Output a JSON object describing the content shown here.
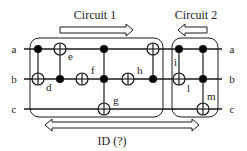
{
  "diagram": {
    "title_circuit1": "Circuit 1",
    "title_circuit2": "Circuit 2",
    "bottom_label": "ID (?)",
    "wires": [
      {
        "name": "a",
        "y": 49,
        "left_label": "a",
        "right_label": "a"
      },
      {
        "name": "b",
        "y": 79,
        "left_label": "b",
        "right_label": "b"
      },
      {
        "name": "c",
        "y": 109,
        "left_label": "c",
        "right_label": "c"
      }
    ],
    "gates": [
      {
        "x": 38,
        "controls": [
          "a"
        ],
        "target": "b",
        "label": "d"
      },
      {
        "x": 60,
        "controls": [
          "b"
        ],
        "target": "a",
        "label": "e"
      },
      {
        "x": 82,
        "controls": [],
        "target": "b",
        "label": "f"
      },
      {
        "x": 104,
        "controls": [
          "a",
          "b"
        ],
        "target": "c",
        "label": "g"
      },
      {
        "x": 128,
        "controls": [],
        "target": "b",
        "label": "h"
      },
      {
        "x": 153,
        "controls": [
          "b"
        ],
        "target": "a",
        "label": ""
      },
      {
        "x": 179,
        "controls": [
          "a"
        ],
        "target": "b",
        "label": "i"
      },
      {
        "x": 203,
        "controls": [
          "a",
          "b"
        ],
        "target": "c",
        "label": "m"
      }
    ],
    "extra_labels": [
      "l"
    ],
    "arrows": {
      "circuit1": "right",
      "circuit2": "left",
      "identity": "double"
    },
    "colors": {
      "line": "#1a1a1a",
      "text": "#222222",
      "background": "#ffffff"
    }
  }
}
